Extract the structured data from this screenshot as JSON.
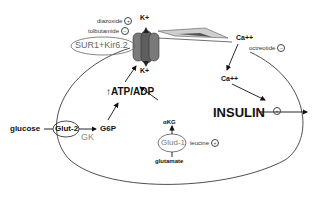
{
  "diagram": {
    "channel": {
      "label": "SUR1+Kir6.2",
      "k_top": "K+",
      "k_bottom": "K+"
    },
    "drugs": {
      "diazoxide": {
        "label": "diazoxide",
        "effect": "+"
      },
      "tolbutamide": {
        "label": "tolbutamide",
        "effect": "−"
      },
      "octreotide": {
        "label": "octreotide",
        "effect": "−"
      },
      "leucine": {
        "label": "leucine",
        "effect": "+"
      }
    },
    "calcium": {
      "outside": "Ca++",
      "inside": "Ca++"
    },
    "metabolism": {
      "atp_adp": "↑ATP/ADP",
      "glucose": "glucose",
      "glut2": "Glut-2",
      "gk": "GK",
      "g6p": "G6P",
      "akg": "αKG",
      "glud1": "Glud-1",
      "glutamate": "glutamate"
    },
    "output": {
      "insulin": "INSULIN",
      "insulin_effect": "+"
    },
    "colors": {
      "line": "#222222",
      "channel_fill": "#6e6e6e",
      "gray_text": "#888888"
    }
  }
}
